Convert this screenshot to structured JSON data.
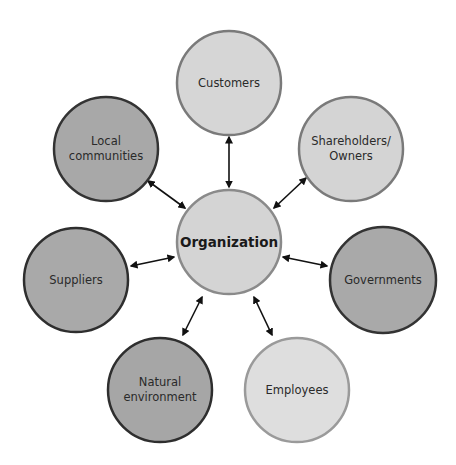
{
  "diagram": {
    "type": "stakeholder-hub",
    "center": {
      "label": "Organization",
      "cx": 229,
      "cy": 242,
      "r": 52,
      "fill": "#d4d4d4",
      "stroke": "#8a8a8a"
    },
    "nodes": [
      {
        "id": "customers",
        "lines": [
          "Customers"
        ],
        "cx": 229,
        "cy": 83,
        "r": 52,
        "fill": "#d6d6d6",
        "stroke": "#7a7a7a",
        "arrow": {
          "x1": 229,
          "y1": 137,
          "x2": 229,
          "y2": 187
        }
      },
      {
        "id": "shareholders",
        "lines": [
          "Shareholders/",
          "Owners"
        ],
        "cx": 351,
        "cy": 149,
        "r": 52,
        "fill": "#d4d4d4",
        "stroke": "#7a7a7a",
        "arrow": {
          "x1": 306,
          "y1": 178,
          "x2": 274,
          "y2": 208
        }
      },
      {
        "id": "governments",
        "lines": [
          "Governments"
        ],
        "cx": 383,
        "cy": 280,
        "r": 53,
        "fill": "#a9a9a9",
        "stroke": "#333333",
        "arrow": {
          "x1": 327,
          "y1": 266,
          "x2": 283,
          "y2": 257
        }
      },
      {
        "id": "employees",
        "lines": [
          "Employees"
        ],
        "cx": 297,
        "cy": 390,
        "r": 52,
        "fill": "#dedede",
        "stroke": "#9a9a9a",
        "arrow": {
          "x1": 272,
          "y1": 335,
          "x2": 254,
          "y2": 297
        }
      },
      {
        "id": "natural-environment",
        "lines": [
          "Natural",
          "environment"
        ],
        "cx": 160,
        "cy": 390,
        "r": 52,
        "fill": "#a6a6a6",
        "stroke": "#2e2e2e",
        "arrow": {
          "x1": 183,
          "y1": 335,
          "x2": 202,
          "y2": 297
        }
      },
      {
        "id": "suppliers",
        "lines": [
          "Suppliers"
        ],
        "cx": 76,
        "cy": 280,
        "r": 52,
        "fill": "#a9a9a9",
        "stroke": "#2e2e2e",
        "arrow": {
          "x1": 131,
          "y1": 266,
          "x2": 174,
          "y2": 257
        }
      },
      {
        "id": "local-communities",
        "lines": [
          "Local",
          "communities"
        ],
        "cx": 106,
        "cy": 149,
        "r": 52,
        "fill": "#a8a8a8",
        "stroke": "#333333",
        "arrow": {
          "x1": 148,
          "y1": 181,
          "x2": 185,
          "y2": 208
        }
      }
    ],
    "arrow_color": "#111111"
  }
}
